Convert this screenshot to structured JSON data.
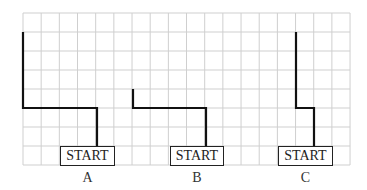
{
  "grid": {
    "x0": 23,
    "y0": 13,
    "cols": 18,
    "rows": 8,
    "cell_w": 18.17,
    "cell_h": 19,
    "line_color": "#cfcfcf"
  },
  "path_color": "#111111",
  "figures": [
    {
      "id": "A",
      "label": "A",
      "start_label": "START",
      "box": {
        "x": 60,
        "y": 146,
        "w": 55
      },
      "label_x": 60,
      "path": [
        [
          97,
          146
        ],
        [
          97,
          108
        ],
        [
          23,
          108
        ],
        [
          23,
          32
        ]
      ]
    },
    {
      "id": "B",
      "label": "B",
      "start_label": "START",
      "box": {
        "x": 170,
        "y": 146,
        "w": 54
      },
      "label_x": 170,
      "path": [
        [
          206,
          146
        ],
        [
          206,
          108
        ],
        [
          133,
          108
        ],
        [
          133,
          89
        ]
      ]
    },
    {
      "id": "C",
      "label": "C",
      "start_label": "START",
      "box": {
        "x": 278,
        "y": 146,
        "w": 55
      },
      "label_x": 278,
      "path": [
        [
          314,
          146
        ],
        [
          314,
          108
        ],
        [
          296,
          108
        ],
        [
          296,
          32
        ]
      ]
    }
  ]
}
